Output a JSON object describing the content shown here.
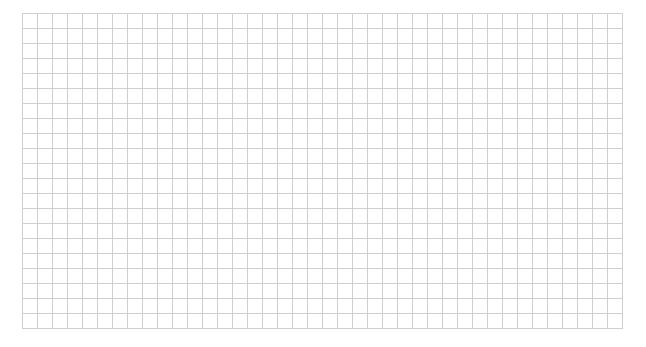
{
  "page": {
    "top_text_clipped": "",
    "grid": {
      "columns": 40,
      "rows": 21,
      "cell_size_px": 15,
      "line_color": "#cfcfcf",
      "background": "#ffffff"
    }
  }
}
